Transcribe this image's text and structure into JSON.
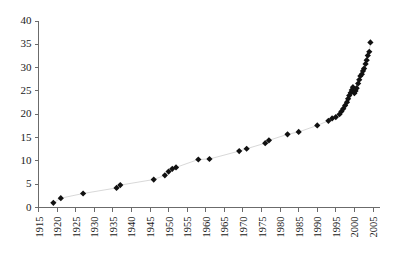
{
  "chart_data": {
    "type": "scatter",
    "title": "",
    "subtitle": "",
    "xlabel": "",
    "ylabel": "",
    "xlim": [
      1915,
      2005
    ],
    "ylim": [
      0,
      40
    ],
    "xticks": [
      1915,
      1920,
      1925,
      1930,
      1935,
      1940,
      1945,
      1950,
      1955,
      1960,
      1965,
      1970,
      1975,
      1980,
      1985,
      1990,
      1995,
      2000,
      2005
    ],
    "yticks": [
      0,
      5,
      10,
      15,
      20,
      25,
      30,
      35,
      40
    ],
    "grid": false,
    "legend": null,
    "legend_position": "none",
    "marker": "diamond",
    "marker_color": "#111111",
    "line_color": "#d4d4d4",
    "series": [
      {
        "name": "series-1",
        "x": [
          1919,
          1921,
          1927,
          1936,
          1937,
          1946,
          1949,
          1950,
          1951,
          1952,
          1958,
          1961,
          1969,
          1971,
          1976,
          1977,
          1982,
          1985,
          1990,
          1993,
          1994,
          1995,
          1996,
          1996.5,
          1997,
          1997.5,
          1998,
          1998.3,
          1998.6,
          1999,
          1999.3,
          1999.6,
          2000,
          2000.3,
          2000.6,
          2001,
          2001.3,
          2001.6,
          2002,
          2002.3,
          2002.6,
          2003,
          2003.3,
          2003.6,
          2004,
          2004.3
        ],
        "y": [
          1.0,
          2.0,
          3.0,
          4.2,
          4.8,
          6.0,
          6.9,
          7.7,
          8.3,
          8.6,
          10.3,
          10.4,
          12.1,
          12.6,
          13.8,
          14.4,
          15.7,
          16.2,
          17.6,
          18.6,
          19.1,
          19.4,
          20.0,
          20.6,
          21.2,
          21.9,
          22.6,
          23.3,
          24.0,
          24.6,
          25.2,
          25.8,
          24.5,
          25.0,
          25.6,
          26.6,
          27.4,
          28.2,
          28.6,
          29.3,
          29.8,
          30.8,
          31.6,
          32.6,
          33.4,
          35.4
        ]
      }
    ]
  },
  "axes": {
    "x_tick_labels": [
      "1915",
      "1920",
      "1925",
      "1930",
      "1935",
      "1940",
      "1945",
      "1950",
      "1955",
      "1960",
      "1965",
      "1970",
      "1975",
      "1980",
      "1985",
      "1990",
      "1995",
      "2000",
      "2005"
    ],
    "y_tick_labels": [
      "0",
      "5",
      "10",
      "15",
      "20",
      "25",
      "30",
      "35",
      "40"
    ]
  },
  "colors": {
    "marker": "#111111",
    "line": "#d4d4d4",
    "axis": "#6b6b6b",
    "text": "#1a1a1a",
    "background": "#ffffff"
  }
}
